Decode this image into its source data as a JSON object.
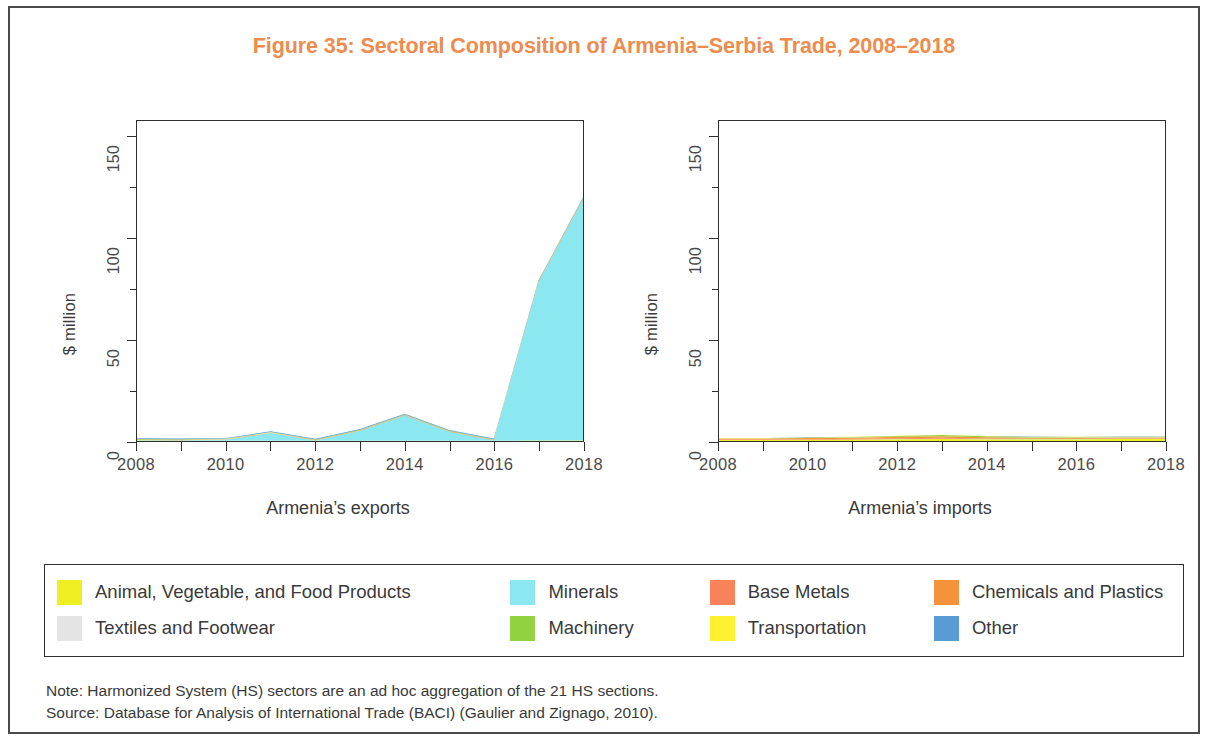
{
  "figure": {
    "title": "Figure 35: Sectoral Composition of Armenia–Serbia Trade, 2008–2018",
    "title_color": "#ed8c4e"
  },
  "panels": [
    {
      "id": "exports",
      "caption": "Armenia’s exports"
    },
    {
      "id": "imports",
      "caption": "Armenia’s imports"
    }
  ],
  "axes": {
    "ylabel": "$ million",
    "yticks": [
      0,
      50,
      100,
      150
    ],
    "ytick_labels": [
      "0",
      "50",
      "100",
      "150"
    ],
    "yminor": [
      25,
      75,
      125
    ],
    "ylim": [
      0,
      158
    ],
    "xlim": [
      2008,
      2018
    ],
    "xticks": [
      2008,
      2009,
      2010,
      2011,
      2012,
      2013,
      2014,
      2015,
      2016,
      2017,
      2018
    ],
    "xtick_labels": [
      {
        "value": 2008,
        "label": "2008"
      },
      {
        "value": 2010,
        "label": "2010"
      },
      {
        "value": 2012,
        "label": "2012"
      },
      {
        "value": 2014,
        "label": "2014"
      },
      {
        "value": 2016,
        "label": "2016"
      },
      {
        "value": 2018,
        "label": "2018"
      }
    ]
  },
  "legend": {
    "rows": [
      [
        {
          "label": "Animal, Vegetable, and Food Products",
          "color": "#eeee22",
          "key": "food"
        },
        {
          "label": "Minerals",
          "color": "#8ce8f0",
          "key": "minerals"
        },
        {
          "label": "Base Metals",
          "color": "#f8835a",
          "key": "base_metals"
        },
        {
          "label": "Chemicals and Plastics",
          "color": "#f5933c",
          "key": "chemicals"
        }
      ],
      [
        {
          "label": "Textiles and Footwear",
          "color": "#e4e4e4",
          "key": "textiles"
        },
        {
          "label": "Machinery",
          "color": "#92d13f",
          "key": "machinery"
        },
        {
          "label": "Transportation",
          "color": "#fff030",
          "key": "transportation"
        },
        {
          "label": "Other",
          "color": "#5b9bd5",
          "key": "other"
        }
      ]
    ]
  },
  "footnotes": [
    "Note: Harmonized System (HS) sectors are an ad hoc aggregation of the 21 HS sections.",
    "Source: Database for Analysis of International Trade (BACI) (Gaulier and Zignago, 2010)."
  ],
  "chart_data": {
    "type": "area",
    "title": "Figure 35: Sectoral Composition of Armenia–Serbia Trade, 2008–2018",
    "stacked": true,
    "xlabel": "",
    "ylabel": "$ million",
    "ylim": [
      0,
      158
    ],
    "grid": false,
    "legend_position": "bottom",
    "x": [
      2008,
      2009,
      2010,
      2011,
      2012,
      2013,
      2014,
      2015,
      2016,
      2017,
      2018
    ],
    "panels": [
      {
        "name": "Armenia’s exports",
        "series": [
          {
            "name": "Animal, Vegetable, and Food Products",
            "color": "#eeee22",
            "values": [
              0.2,
              0.1,
              0.1,
              0.1,
              0.1,
              0.1,
              0.1,
              0.1,
              0.1,
              0.2,
              0.2
            ]
          },
          {
            "name": "Minerals",
            "color": "#8ce8f0",
            "values": [
              0.3,
              0.3,
              0.6,
              3.8,
              0.2,
              5.0,
              12.5,
              4.5,
              0.3,
              78.0,
              119.0
            ]
          },
          {
            "name": "Base Metals",
            "color": "#f8835a",
            "values": [
              0.1,
              0.1,
              0.1,
              0.1,
              0.1,
              0.1,
              0.1,
              0.1,
              0.1,
              0.2,
              0.3
            ]
          },
          {
            "name": "Chemicals and Plastics",
            "color": "#f5933c",
            "values": [
              0.1,
              0.1,
              0.1,
              0.1,
              0.1,
              0.1,
              0.1,
              0.1,
              0.1,
              0.1,
              0.1
            ]
          },
          {
            "name": "Textiles and Footwear",
            "color": "#e4e4e4",
            "values": [
              0.05,
              0.05,
              0.05,
              0.05,
              0.05,
              0.05,
              0.05,
              0.05,
              0.05,
              0.05,
              0.05
            ]
          },
          {
            "name": "Machinery",
            "color": "#92d13f",
            "values": [
              0.2,
              0.2,
              0.2,
              0.2,
              0.2,
              0.2,
              0.2,
              0.2,
              0.2,
              0.3,
              0.3
            ]
          },
          {
            "name": "Transportation",
            "color": "#fff030",
            "values": [
              0.05,
              0.05,
              0.05,
              0.05,
              0.05,
              0.05,
              0.05,
              0.05,
              0.05,
              0.05,
              0.05
            ]
          },
          {
            "name": "Other",
            "color": "#5b9bd5",
            "values": [
              0.3,
              0.3,
              0.3,
              0.4,
              0.3,
              0.3,
              0.3,
              0.3,
              0.3,
              0.3,
              0.3
            ]
          }
        ]
      },
      {
        "name": "Armenia’s imports",
        "series": [
          {
            "name": "Animal, Vegetable, and Food Products",
            "color": "#eeee22",
            "values": [
              0.5,
              0.5,
              0.6,
              0.7,
              0.9,
              1.0,
              0.9,
              0.9,
              0.9,
              1.0,
              1.0
            ]
          },
          {
            "name": "Minerals",
            "color": "#8ce8f0",
            "values": [
              0.05,
              0.05,
              0.05,
              0.05,
              0.05,
              0.05,
              0.05,
              0.05,
              0.05,
              0.05,
              0.05
            ]
          },
          {
            "name": "Base Metals",
            "color": "#f8835a",
            "values": [
              0.2,
              0.2,
              0.2,
              0.3,
              0.4,
              0.5,
              0.3,
              0.2,
              0.2,
              0.2,
              0.2
            ]
          },
          {
            "name": "Chemicals and Plastics",
            "color": "#f5933c",
            "values": [
              0.5,
              0.5,
              0.6,
              0.6,
              0.7,
              0.8,
              0.6,
              0.5,
              0.5,
              0.5,
              0.5
            ]
          },
          {
            "name": "Textiles and Footwear",
            "color": "#e4e4e4",
            "values": [
              0.05,
              0.05,
              0.05,
              0.05,
              0.05,
              0.05,
              0.05,
              0.05,
              0.05,
              0.05,
              0.05
            ]
          },
          {
            "name": "Machinery",
            "color": "#92d13f",
            "values": [
              0.1,
              0.1,
              0.2,
              0.3,
              0.4,
              0.6,
              0.5,
              0.4,
              0.3,
              0.3,
              0.3
            ]
          },
          {
            "name": "Transportation",
            "color": "#fff030",
            "values": [
              0.05,
              0.05,
              0.05,
              0.05,
              0.05,
              0.05,
              0.05,
              0.05,
              0.05,
              0.05,
              0.05
            ]
          },
          {
            "name": "Other",
            "color": "#5b9bd5",
            "values": [
              0.05,
              0.05,
              0.05,
              0.05,
              0.05,
              0.05,
              0.05,
              0.05,
              0.05,
              0.05,
              0.05
            ]
          }
        ]
      }
    ]
  }
}
